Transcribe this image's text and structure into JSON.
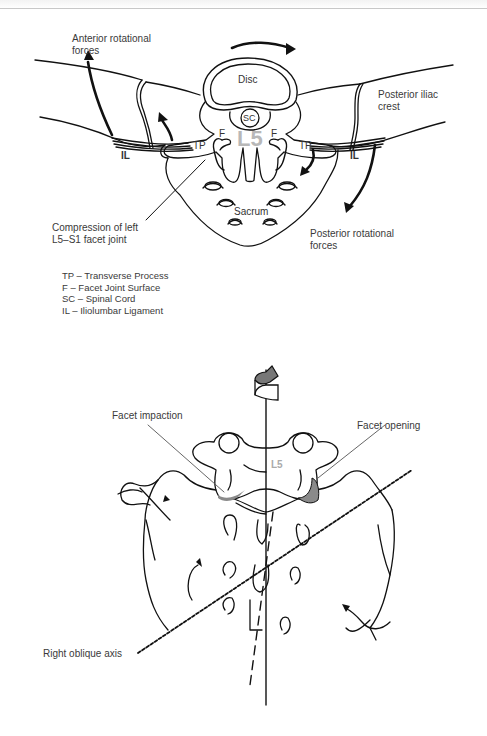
{
  "top_diagram": {
    "labels": {
      "anterior_forces": [
        "Anterior rotational",
        "forces"
      ],
      "posterior_crest": [
        "Posterior iliac",
        "crest"
      ],
      "compression": [
        "Compression of left",
        "L5–S1 facet joint"
      ],
      "posterior_forces": [
        "Posterior rotational",
        "forces"
      ]
    },
    "inner": {
      "disc": "Disc",
      "sc": "SC",
      "l5": "L5",
      "f_left": "F",
      "f_right": "F",
      "tp_left": "TP",
      "tp_right": "TP",
      "il_left": "IL",
      "il_right": "IL",
      "sacrum": "Sacrum"
    },
    "legend": [
      "TP – Transverse Process",
      "F – Facet Joint Surface",
      "SC – Spinal Cord",
      "IL – Iliolumbar Ligament"
    ]
  },
  "bottom_diagram": {
    "labels": {
      "impaction": "Facet impaction",
      "opening": "Facet opening",
      "axis": "Right oblique axis",
      "l5": "L5"
    }
  },
  "colors": {
    "line": "#111111",
    "text": "#3a3a3a",
    "l5_gray": "#b8b8b8",
    "facet_fill": "#8a8a8a"
  }
}
